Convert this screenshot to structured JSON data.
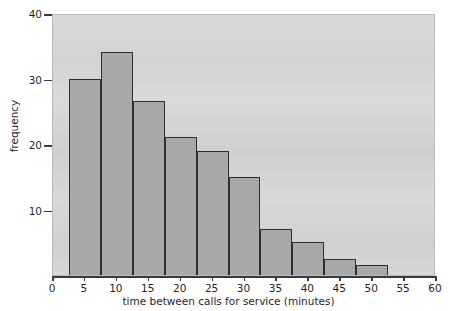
{
  "chart_data": {
    "type": "bar",
    "title": "",
    "subtitle": "",
    "xlabel": "time between calls for service (minutes)",
    "ylabel": "frequency",
    "xlim": [
      0,
      60
    ],
    "ylim": [
      0,
      40
    ],
    "grid": false,
    "legend": null,
    "bin_width": 5,
    "bin_edges": [
      2.5,
      7.5,
      12.5,
      17.5,
      22.5,
      27.5,
      32.5,
      37.5,
      42.5,
      47.5,
      52.5
    ],
    "categories": [
      "2.5-7.5",
      "7.5-12.5",
      "12.5-17.5",
      "17.5-22.5",
      "22.5-27.5",
      "27.5-32.5",
      "32.5-37.5",
      "37.5-42.5",
      "42.5-47.5",
      "47.5-52.5"
    ],
    "values": [
      30,
      34,
      26.5,
      21,
      19,
      15,
      7,
      5,
      2.5,
      1.5
    ],
    "xticks": [
      0,
      5,
      10,
      15,
      20,
      25,
      30,
      35,
      40,
      45,
      50,
      55,
      60
    ],
    "xtick_labels": [
      "0",
      "5",
      "10",
      "15",
      "20",
      "25",
      "30",
      "35",
      "40",
      "45",
      "50",
      "55",
      "60"
    ],
    "yticks": [
      10,
      20,
      30,
      40
    ],
    "ytick_labels": [
      "10",
      "20",
      "30",
      "40"
    ],
    "colors": {
      "bar_fill": "#a8a8a8",
      "bar_edge": "#2e2e2e",
      "plot_background": "#d4d4d4",
      "axis": "#3a3a3a",
      "text": "#1f1f1f",
      "page_background": "#ffffff"
    }
  }
}
